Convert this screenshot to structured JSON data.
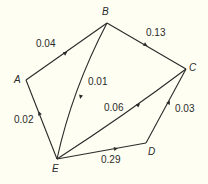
{
  "diagram": {
    "type": "directed weighted graph",
    "nodes": [
      {
        "id": "A",
        "label": "A"
      },
      {
        "id": "B",
        "label": "B"
      },
      {
        "id": "C",
        "label": "C"
      },
      {
        "id": "D",
        "label": "D"
      },
      {
        "id": "E",
        "label": "E"
      }
    ],
    "edges": [
      {
        "from": "A",
        "to": "B",
        "weight": "0.04"
      },
      {
        "from": "B",
        "to": "C",
        "weight": "0.13"
      },
      {
        "from": "B",
        "to": "E",
        "weight": "0.01"
      },
      {
        "from": "E",
        "to": "C",
        "weight": "0.06"
      },
      {
        "from": "D",
        "to": "C",
        "weight": "0.03"
      },
      {
        "from": "E",
        "to": "A",
        "weight": "0.02"
      },
      {
        "from": "E",
        "to": "D",
        "weight": "0.29"
      }
    ],
    "colors": {
      "background": "#fefef2",
      "line": "#2a2a2a"
    }
  }
}
